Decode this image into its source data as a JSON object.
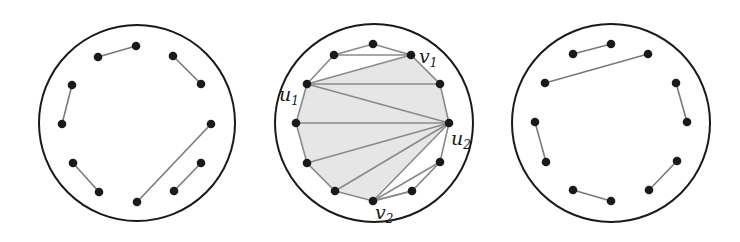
{
  "panels": [
    {
      "name": "left",
      "circle": {
        "cx": 137,
        "cy": 123,
        "r": 98
      },
      "points": [
        [
          98,
          57
        ],
        [
          136,
          46
        ],
        [
          173,
          56
        ],
        [
          201,
          84
        ],
        [
          72,
          85
        ],
        [
          62,
          124
        ],
        [
          211,
          124
        ],
        [
          137,
          202
        ],
        [
          73,
          163
        ],
        [
          99,
          192
        ],
        [
          201,
          163
        ],
        [
          174,
          191
        ]
      ],
      "edges": [
        [
          0,
          1
        ],
        [
          2,
          3
        ],
        [
          4,
          5
        ],
        [
          6,
          7
        ],
        [
          8,
          9
        ],
        [
          10,
          11
        ]
      ]
    },
    {
      "name": "middle",
      "circle": {
        "cx": 374,
        "cy": 123,
        "r": 99
      },
      "points": [
        [
          307,
          84
        ],
        [
          334,
          55
        ],
        [
          373,
          44
        ],
        [
          411,
          55
        ],
        [
          440,
          84
        ],
        [
          449,
          123
        ],
        [
          440,
          162
        ],
        [
          412,
          191
        ],
        [
          373,
          201
        ],
        [
          335,
          191
        ],
        [
          307,
          163
        ],
        [
          296,
          123
        ]
      ],
      "shaded_polygon": [
        0,
        3,
        4,
        5,
        8,
        9,
        10,
        11
      ],
      "hull": [
        0,
        1,
        2,
        3,
        4,
        5,
        6,
        7,
        8,
        9,
        10,
        11
      ],
      "chords": [
        [
          1,
          3
        ],
        [
          0,
          3
        ],
        [
          0,
          4
        ],
        [
          0,
          5
        ],
        [
          11,
          5
        ],
        [
          10,
          5
        ],
        [
          9,
          5
        ],
        [
          8,
          5
        ],
        [
          8,
          6
        ],
        [
          8,
          7
        ]
      ],
      "labels": [
        {
          "base": "u",
          "sub": "1",
          "x": 279,
          "y": 101
        },
        {
          "base": "v",
          "sub": "1",
          "x": 419,
          "y": 63
        },
        {
          "base": "u",
          "sub": "2",
          "x": 451,
          "y": 145
        },
        {
          "base": "v",
          "sub": "2",
          "x": 375,
          "y": 219
        }
      ]
    },
    {
      "name": "right",
      "circle": {
        "cx": 611,
        "cy": 123,
        "r": 99
      },
      "points": [
        [
          573,
          54
        ],
        [
          611,
          44
        ],
        [
          648,
          54
        ],
        [
          545,
          83
        ],
        [
          676,
          83
        ],
        [
          687,
          122
        ],
        [
          535,
          122
        ],
        [
          546,
          162
        ],
        [
          677,
          161
        ],
        [
          649,
          190
        ],
        [
          573,
          190
        ],
        [
          611,
          201
        ]
      ],
      "edges": [
        [
          0,
          1
        ],
        [
          3,
          2
        ],
        [
          4,
          5
        ],
        [
          6,
          7
        ],
        [
          8,
          9
        ],
        [
          10,
          11
        ]
      ]
    }
  ]
}
